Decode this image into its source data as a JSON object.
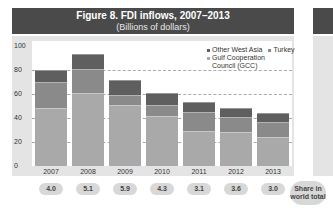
{
  "header": {
    "title": "Figure 8. FDI inflows, 2007–2013",
    "subtitle": "(Billions of dollars)"
  },
  "colors": {
    "gcc": "#a9a9a9",
    "turkey": "#8a8a8a",
    "other_west_asia": "#5f5f5f",
    "title_bg": "#4a4a4a",
    "panel_bg": "#e4e4e4"
  },
  "legend": {
    "other_west_asia": "Other West Asia",
    "turkey": "Turkey",
    "gcc_line1": "Gulf Cooperation",
    "gcc_line2": "Council (GCC)"
  },
  "y_ticks": [
    "100",
    "80",
    "60",
    "40",
    "20",
    "0"
  ],
  "x_labels": [
    "2007",
    "2008",
    "2009",
    "2010",
    "2011",
    "2012",
    "2013"
  ],
  "share": {
    "values": [
      "4.0",
      "5.1",
      "5.9",
      "4.3",
      "3.1",
      "3.6",
      "3.0"
    ],
    "label_line1": "Share in",
    "label_line2": "world total"
  },
  "chart_data": {
    "type": "bar",
    "stacked": true,
    "title": "Figure 8. FDI inflows, 2007–2013",
    "subtitle": "(Billions of dollars)",
    "xlabel": "",
    "ylabel": "Billions of dollars",
    "ylim": [
      0,
      100
    ],
    "yticks": [
      0,
      20,
      40,
      60,
      80,
      100
    ],
    "grid": true,
    "legend_position": "top-right",
    "categories": [
      "2007",
      "2008",
      "2009",
      "2010",
      "2011",
      "2012",
      "2013"
    ],
    "series": [
      {
        "name": "Gulf Cooperation Council (GCC)",
        "values": [
          48,
          61,
          51,
          42,
          29,
          28,
          24
        ]
      },
      {
        "name": "Turkey",
        "values": [
          22,
          20,
          8,
          9,
          16,
          13,
          13
        ]
      },
      {
        "name": "Other West Asia",
        "values": [
          10,
          12,
          13,
          10,
          8,
          7,
          7
        ]
      }
    ],
    "annotations": {
      "share_in_world_total_pct": [
        4.0,
        5.1,
        5.9,
        4.3,
        3.1,
        3.6,
        3.0
      ]
    }
  }
}
